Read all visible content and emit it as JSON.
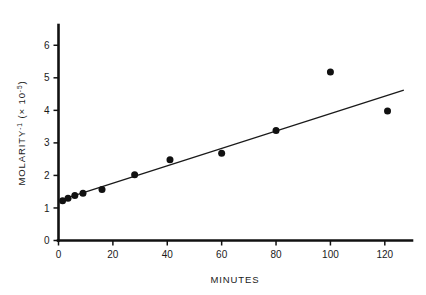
{
  "chart_data": {
    "type": "scatter",
    "title": "",
    "xlabel": "MINUTES",
    "ylabel": "MOLARITY",
    "ylabel_exponent": "-1",
    "ylabel_scale_prefix": "(× 10",
    "ylabel_scale_exponent": "-5",
    "ylabel_scale_suffix": ")",
    "xlim": [
      0,
      130
    ],
    "ylim": [
      0,
      6.5
    ],
    "xticks": [
      0,
      20,
      40,
      60,
      80,
      100,
      120
    ],
    "xtick_labels": [
      "0",
      "20",
      "40",
      "60",
      "80",
      "100",
      "120"
    ],
    "yticks": [
      0,
      1,
      2,
      3,
      4,
      5,
      6
    ],
    "ytick_labels": [
      "0",
      "1",
      "2",
      "3",
      "4",
      "5",
      "6"
    ],
    "grid": false,
    "legend": null,
    "marker": "filled-circle",
    "points": [
      {
        "x": 1.5,
        "y": 1.22
      },
      {
        "x": 3.5,
        "y": 1.3
      },
      {
        "x": 6.0,
        "y": 1.38
      },
      {
        "x": 9.0,
        "y": 1.45
      },
      {
        "x": 16.0,
        "y": 1.57
      },
      {
        "x": 28.0,
        "y": 2.02
      },
      {
        "x": 41.0,
        "y": 2.48
      },
      {
        "x": 60.0,
        "y": 2.68
      },
      {
        "x": 80.0,
        "y": 3.38
      },
      {
        "x": 100.0,
        "y": 5.18
      },
      {
        "x": 121.0,
        "y": 3.98
      }
    ],
    "series": [
      {
        "name": "fit-line",
        "type": "line",
        "x": [
          4.0,
          127.0
        ],
        "y": [
          1.33,
          4.62
        ]
      }
    ]
  }
}
